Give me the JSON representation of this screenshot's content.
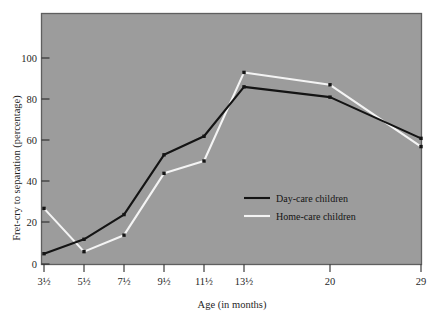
{
  "chart_data": {
    "type": "line",
    "title": "",
    "xlabel": "Age (in months)",
    "ylabel": "Fret-cry to separation (percentage)",
    "categories": [
      "3½",
      "5½",
      "7½",
      "9½",
      "11½",
      "13½",
      "20",
      "29"
    ],
    "x_positions": [
      44,
      84,
      124,
      164,
      204,
      244,
      330,
      421
    ],
    "ylim": [
      0,
      110
    ],
    "yticks": [
      0,
      20,
      40,
      60,
      80,
      100
    ],
    "ytick_labels": [
      "0",
      "20",
      "40",
      "60",
      "80",
      "100"
    ],
    "grid": false,
    "legend_position": "center-right",
    "series": [
      {
        "name": "Day-care children",
        "color": "#141414",
        "values": [
          5,
          12,
          24,
          53,
          62,
          86,
          81,
          61
        ]
      },
      {
        "name": "Home-care children",
        "color": "#f4f4f4",
        "values": [
          27,
          6,
          14,
          44,
          50,
          93,
          87,
          57
        ]
      }
    ]
  },
  "legend": {
    "entries": [
      {
        "label": "Day-care children",
        "color": "#141414"
      },
      {
        "label": "Home-care children",
        "color": "#f4f4f4"
      }
    ]
  },
  "colors": {
    "plot_background": "#9c9c9c",
    "plot_border": "#5f5f5f",
    "page_background": "#ffffff",
    "day_care_line": "#141414",
    "home_care_line": "#f4f4f4",
    "marker": "#141414",
    "text": "#1f1f1f"
  }
}
